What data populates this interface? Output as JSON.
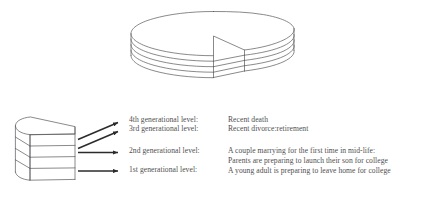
{
  "figure": {
    "title": "",
    "background_color": "#ffffff",
    "line_color": "#58585a",
    "arrow_color": "#2b2b2b",
    "text_color": "#4f4f4f",
    "top_object": {
      "name": "layered-cylinder-with-wedge-removed",
      "layers": 4
    },
    "left_object": {
      "name": "wedge-slice",
      "layers": 4
    },
    "arrows": {
      "count": 4,
      "description": "four arrows pointing right from the wedge slice toward the level labels"
    }
  },
  "levels": [
    {
      "key": "level4",
      "label": "4th generational level:"
    },
    {
      "key": "level3",
      "label": "3rd generational level:"
    },
    {
      "key": "level2",
      "label": "2nd generational level:"
    },
    {
      "key": "level1",
      "label": "1st generational level:"
    }
  ],
  "events": [
    {
      "key": "event1",
      "text": "Recent death"
    },
    {
      "key": "event2",
      "text": "Recent divorce:retirement"
    },
    {
      "key": "event3",
      "text": "A couple marrying for the first time in mid-life:"
    },
    {
      "key": "event4",
      "text": "Parents are preparing to launch their son for college"
    },
    {
      "key": "event5",
      "text": "A young adult is preparing to leave home for college"
    }
  ]
}
